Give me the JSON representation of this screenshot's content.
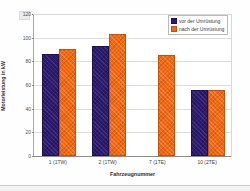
{
  "chart_data": {
    "type": "bar",
    "title": "",
    "xlabel": "Fahrzeugnummer",
    "ylabel": "Motorleistung in kW",
    "categories": [
      "1 (1TW)",
      "2 (1TW)",
      "7 (1TE)",
      "10 (2TE)"
    ],
    "series": [
      {
        "name": "vor der Umrüstung",
        "color": "#2b1a70",
        "values": [
          86,
          92,
          null,
          55
        ]
      },
      {
        "name": "nach der Umrüstung",
        "color": "#f4690f",
        "values": [
          90,
          102,
          85,
          55
        ]
      }
    ],
    "ylim": [
      0,
      120
    ],
    "yticks": [
      0,
      20,
      40,
      60,
      80,
      100,
      120
    ],
    "ytick_labels": [
      "0",
      "20",
      "40",
      "60",
      "80",
      "100",
      "120"
    ],
    "grid": true,
    "legend_position": "top-right"
  },
  "legend": {
    "entries": [
      {
        "label": "vor der Umrüstung"
      },
      {
        "label": "nach der Umrüstung"
      }
    ]
  },
  "axes": {
    "x_title": "Fahrzeugnummer",
    "y_title": "Motorleistung in kW"
  }
}
